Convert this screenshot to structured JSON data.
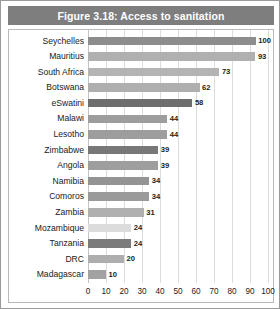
{
  "figure": {
    "title": "Figure 3.18: Access to sanitation",
    "title_bar_color": "#7e7e7e",
    "title_text_color": "#ffffff",
    "frame_border_color": "#9a9a9a"
  },
  "chart_data": {
    "type": "bar",
    "orientation": "horizontal",
    "title": "Figure 3.18: Access to sanitation",
    "xlabel": "",
    "ylabel": "",
    "xlim": [
      0,
      100
    ],
    "grid": true,
    "legend": "none",
    "xticks": [
      "0",
      "10",
      "20",
      "30",
      "40",
      "50",
      "60",
      "70",
      "80",
      "90",
      "100"
    ],
    "xtick_values": [
      0,
      10,
      20,
      30,
      40,
      50,
      60,
      70,
      80,
      90,
      100
    ],
    "categories": [
      "Seychelles",
      "Mauritius",
      "South Africa",
      "Botswana",
      "eSwatini",
      "Malawi",
      "Lesotho",
      "Zimbabwe",
      "Angola",
      "Namibia",
      "Comoros",
      "Zambia",
      "Mozambique",
      "Tanzania",
      "DRC",
      "Madagascar"
    ],
    "values": [
      100,
      93,
      73,
      62,
      58,
      44,
      44,
      39,
      39,
      34,
      34,
      31,
      24,
      24,
      20,
      10
    ],
    "bar_colors": [
      "#8d8d8d",
      "#b0b0b0",
      "#b4b4b4",
      "#afafaf",
      "#6e6e6e",
      "#9d9d9d",
      "#9d9d9d",
      "#787878",
      "#9e9e9e",
      "#949494",
      "#9a9a9a",
      "#b0b0b0",
      "#dcdcdc",
      "#7b7b7b",
      "#aeaeae",
      "#a2a2a2"
    ],
    "data_labels": [
      "100",
      "93",
      "73",
      "62",
      "58",
      "44",
      "44",
      "39",
      "39",
      "34",
      "34",
      "31",
      "24",
      "24",
      "20",
      "10"
    ]
  }
}
